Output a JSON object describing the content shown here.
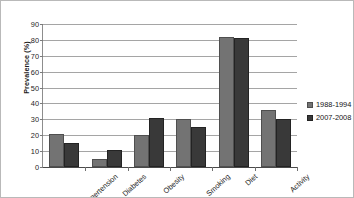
{
  "chart_data": {
    "type": "bar",
    "title": "",
    "xlabel": "",
    "ylabel": "Prevalence (%)",
    "ylim": [
      0,
      90
    ],
    "ytick_step": 10,
    "yticks": [
      0,
      10,
      20,
      30,
      40,
      50,
      60,
      70,
      80,
      90
    ],
    "grid": true,
    "legend_position": "right",
    "categories": [
      "Hypertension",
      "Diabetes",
      "Obesity",
      "Smoking",
      "Diet",
      "Activity"
    ],
    "series": [
      {
        "name": "1988-1994",
        "color": "#737373",
        "values": [
          21,
          5,
          20,
          30,
          82,
          36
        ]
      },
      {
        "name": "2007-2008",
        "color": "#393939",
        "values": [
          15,
          10.5,
          31,
          25,
          81,
          30
        ]
      }
    ]
  }
}
